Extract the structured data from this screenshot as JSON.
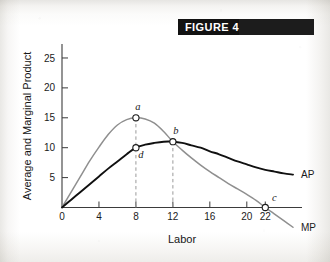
{
  "figure": {
    "banner_label": "FIGURE 4"
  },
  "chart_data": {
    "type": "line",
    "title": "FIGURE 4",
    "xlabel": "Labor",
    "ylabel": "Average and Marginal Product",
    "xlim": [
      0,
      26
    ],
    "ylim": [
      0,
      27
    ],
    "grid": false,
    "legend": "inline-right",
    "x_ticks": [
      "0",
      "4",
      "8",
      "12",
      "16",
      "20",
      "22"
    ],
    "x_tick_values": [
      0,
      4,
      8,
      12,
      16,
      20,
      22
    ],
    "y_ticks": [
      "5",
      "10",
      "15",
      "20",
      "25"
    ],
    "y_tick_values": [
      5,
      10,
      15,
      20,
      25
    ],
    "series": [
      {
        "name": "MP",
        "label": "MP",
        "color": "#8f8f8f",
        "x": [
          0,
          1,
          2,
          3,
          4,
          5,
          6,
          7,
          8,
          9,
          10,
          11,
          12,
          13,
          14,
          15,
          16,
          17,
          18,
          19,
          20,
          21,
          22,
          23,
          24,
          25
        ],
        "values": [
          0,
          2.6,
          5.2,
          7.8,
          10.1,
          12.2,
          13.8,
          14.7,
          15.0,
          14.8,
          14.1,
          12.7,
          11.0,
          9.6,
          8.3,
          7.1,
          6.0,
          5.0,
          4.0,
          3.1,
          2.2,
          1.2,
          0.0,
          -1.1,
          -2.2,
          -3.3
        ]
      },
      {
        "name": "AP",
        "label": "AP",
        "color": "#101010",
        "x": [
          0,
          1,
          2,
          3,
          4,
          5,
          6,
          7,
          8,
          9,
          10,
          11,
          12,
          13,
          14,
          15,
          16,
          17,
          18,
          19,
          20,
          21,
          22,
          23,
          24,
          25
        ],
        "values": [
          0,
          1.3,
          2.6,
          3.9,
          5.2,
          6.5,
          7.7,
          8.9,
          10.0,
          10.5,
          10.8,
          11.0,
          11.0,
          10.8,
          10.4,
          10.0,
          9.4,
          8.9,
          8.3,
          7.7,
          7.2,
          6.7,
          6.3,
          6.0,
          5.7,
          5.5
        ]
      }
    ],
    "annotations": [
      {
        "key": "a",
        "label": "a",
        "x": 8,
        "y": 15.0,
        "series": "MP",
        "note": "maximum marginal product"
      },
      {
        "key": "d",
        "label": "d",
        "x": 8,
        "y": 10.0,
        "series": "AP",
        "note": "average product at L = 8"
      },
      {
        "key": "b",
        "label": "b",
        "x": 12,
        "y": 11.0,
        "series": "AP",
        "note": "MP crosses AP at AP maximum"
      },
      {
        "key": "c",
        "label": "c",
        "x": 22,
        "y": 0.0,
        "series": "MP",
        "note": "marginal product equals zero"
      }
    ],
    "dropline_x": [
      8,
      12
    ]
  }
}
